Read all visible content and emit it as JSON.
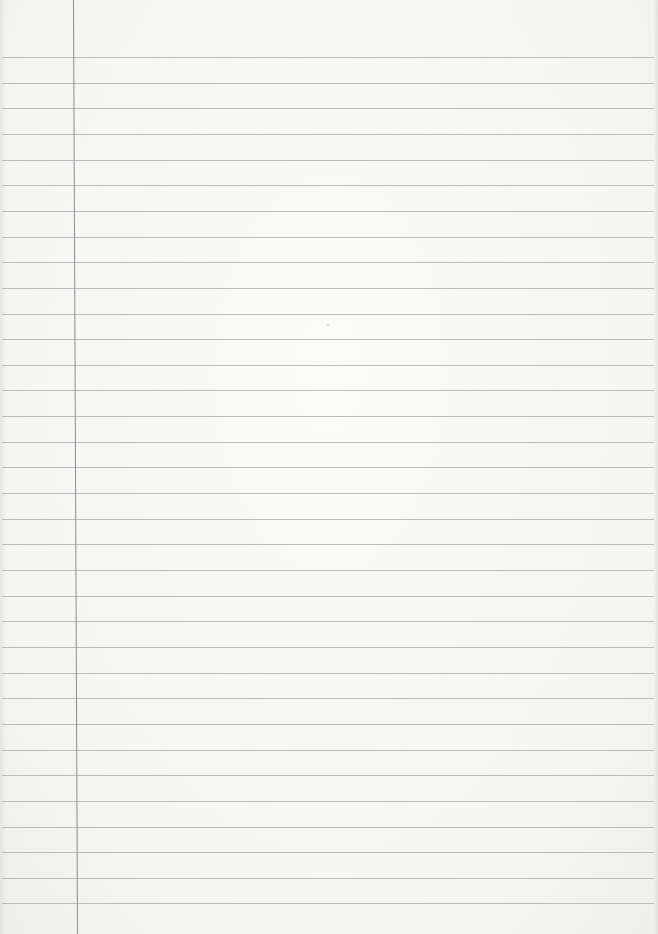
{
  "page": {
    "type": "lined-paper-sheet",
    "background_color": "#f6f6f4",
    "rule_color": "#bcbcbc",
    "margin_line_color": "#8e8e8e",
    "rule_count": 34,
    "first_rule_y": 57,
    "rule_spacing_px": 25.65,
    "margin_line_x_top": 73,
    "margin_line_x_bottom": 77,
    "text": ""
  }
}
